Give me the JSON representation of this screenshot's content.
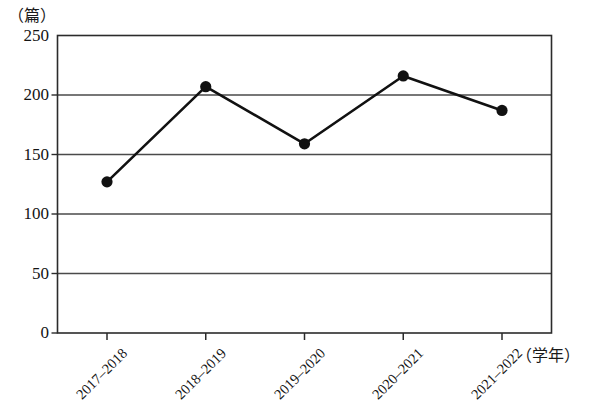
{
  "chart_data": {
    "type": "line",
    "title": "",
    "subtitle": "",
    "xlabel": "（学年）",
    "ylabel": "（篇）",
    "categories": [
      "2017–2018",
      "2018–2019",
      "2019–2020",
      "2020–2021",
      "2021–2022"
    ],
    "values": [
      127,
      207,
      159,
      216,
      187
    ],
    "series": [
      {
        "name": "",
        "values": [
          127,
          207,
          159,
          216,
          187
        ]
      }
    ],
    "ylim": [
      0,
      250
    ],
    "y_ticks": [
      0,
      50,
      100,
      150,
      200,
      250
    ],
    "y_tick_labels": [
      "0",
      "50",
      "100",
      "150",
      "200",
      "250"
    ],
    "grid": "horizontal",
    "legend": "none",
    "marker": "filled-circle",
    "line_color": "#111111",
    "marker_color": "#111111",
    "grid_color": "#4a4a4a",
    "axis_color": "#2b2b2b",
    "background": "#ffffff",
    "annotations": []
  },
  "axes": {
    "y_unit_label": "（篇）",
    "x_unit_label": "（学年）"
  }
}
